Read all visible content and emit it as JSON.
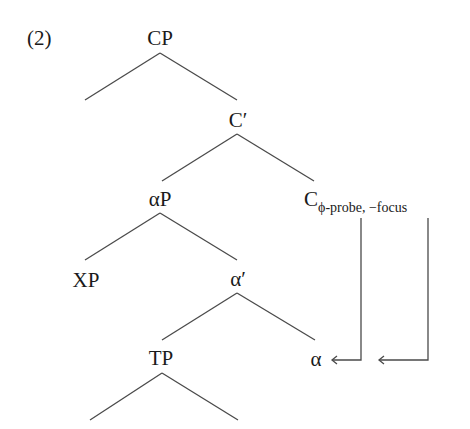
{
  "example": {
    "number": "(2)"
  },
  "tree": {
    "nodes": {
      "cp": "CP",
      "c_bar": "C′",
      "alpha_p": "αP",
      "c_head": "C",
      "c_head_subscript": "ϕ-probe, −focus",
      "xp": "XP",
      "alpha_bar": "α′",
      "tp": "TP",
      "alpha_head": "α"
    },
    "arrows": [
      {
        "from": "ϕ-probe",
        "to": "α"
      },
      {
        "from": "−focus",
        "to": "α"
      }
    ]
  }
}
